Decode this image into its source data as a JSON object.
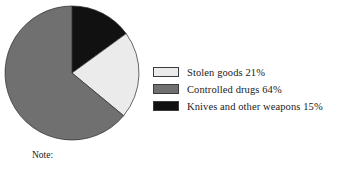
{
  "chart_data": {
    "type": "pie",
    "title": "",
    "categories": [
      "Stolen goods",
      "Controlled drugs",
      "Knives and other weapons"
    ],
    "values": [
      21,
      64,
      15
    ],
    "value_unit": "%",
    "legend_position": "right",
    "start_angle_deg": 0,
    "direction": "clockwise",
    "slice_colors": [
      "#ebebeb",
      "#707070",
      "#111111"
    ],
    "slices": [
      {
        "label": "Stolen goods",
        "value": 21,
        "display_value": "21%",
        "color": "#ebebeb",
        "legend_text": "Stolen goods  21%"
      },
      {
        "label": "Controlled drugs",
        "value": 64,
        "display_value": "64%",
        "color": "#707070",
        "legend_text": "Controlled drugs 64%"
      },
      {
        "label": "Knives and other weapons",
        "value": 15,
        "display_value": "15%",
        "color": "#111111",
        "legend_text": "Knives and other weapons  15%"
      }
    ]
  },
  "legend": {
    "items": [
      {
        "swatch_name": "legend-swatch-stolen-goods",
        "text": "Stolen goods  21%",
        "color": "#ebebeb"
      },
      {
        "swatch_name": "legend-swatch-controlled-drugs",
        "text": "Controlled drugs 64%",
        "color": "#707070"
      },
      {
        "swatch_name": "legend-swatch-knives-weapons",
        "text": "Knives and other weapons  15%",
        "color": "#111111"
      }
    ]
  },
  "footnote": {
    "text": "Note:"
  },
  "geometry": {
    "center_x": 72,
    "center_y": 73,
    "radius": 67
  }
}
